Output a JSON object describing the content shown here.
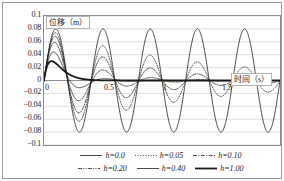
{
  "chart_data": {
    "type": "line",
    "title": "",
    "xlabel": "时间（s）",
    "ylabel": "位移（m）",
    "xlim": [
      0,
      2
    ],
    "ylim": [
      -0.1,
      0.1
    ],
    "grid": true,
    "legend_position": "bottom",
    "yticks": [
      "0.1",
      "0.08",
      "0.06",
      "0.04",
      "0.02",
      "0",
      "−0.02",
      "−0.04",
      "−0.06",
      "−0.08",
      "−0.1"
    ],
    "ytick_values": [
      0.1,
      0.08,
      0.06,
      0.04,
      0.02,
      0,
      -0.02,
      -0.04,
      -0.06,
      -0.08,
      -0.1
    ],
    "xticks": [
      "0",
      "0.5",
      "1",
      "1.5",
      "2"
    ],
    "xtick_values": [
      0,
      0.5,
      1,
      1.5,
      2
    ],
    "period": 0.4,
    "series": [
      {
        "name": "h=0.0",
        "damping": 0.0,
        "amplitude": 0.08,
        "style": "solid",
        "width": 0.8,
        "peaks": [
          0.08,
          0.08,
          0.08,
          0.08,
          0.08
        ],
        "troughs": [
          -0.08,
          -0.08,
          -0.08,
          -0.08
        ]
      },
      {
        "name": "h=0.05",
        "damping": 0.05,
        "amplitude": 0.08,
        "style": "dotted",
        "width": 0.8,
        "peaks": [
          0.069,
          0.052,
          0.04,
          0.03,
          0.023
        ],
        "troughs": [
          -0.06,
          -0.046,
          -0.035,
          -0.026
        ]
      },
      {
        "name": "h=0.10",
        "damping": 0.1,
        "amplitude": 0.08,
        "style": "dash-dot",
        "width": 0.8,
        "peaks": [
          0.06,
          0.038,
          0.024,
          0.015,
          0.009
        ],
        "troughs": [
          -0.047,
          -0.03,
          -0.019,
          -0.012
        ]
      },
      {
        "name": "h=0.20",
        "damping": 0.2,
        "amplitude": 0.08,
        "style": "dash-dot-dot",
        "width": 0.8,
        "peaks": [
          0.049,
          0.02,
          0.008,
          0.003,
          0.001
        ],
        "troughs": [
          -0.031,
          -0.013,
          -0.005,
          -0.002
        ]
      },
      {
        "name": "h=0.40",
        "damping": 0.4,
        "amplitude": 0.08,
        "style": "solid",
        "width": 0.8,
        "peaks": [
          0.04,
          0.008,
          0.002,
          0.0,
          0.0
        ],
        "troughs": [
          -0.016,
          -0.003,
          -0.001,
          0.0
        ]
      },
      {
        "name": "h=1.00",
        "damping": 1.0,
        "amplitude": 0.08,
        "style": "solid",
        "width": 1.8,
        "peaks": [
          0.03,
          0.0,
          0.0,
          0.0,
          0.0
        ],
        "troughs": [
          -0.002,
          0.0,
          0.0,
          0.0
        ]
      }
    ]
  },
  "axes": {
    "y_title": "位移（m）",
    "x_title": "时间（s）"
  }
}
